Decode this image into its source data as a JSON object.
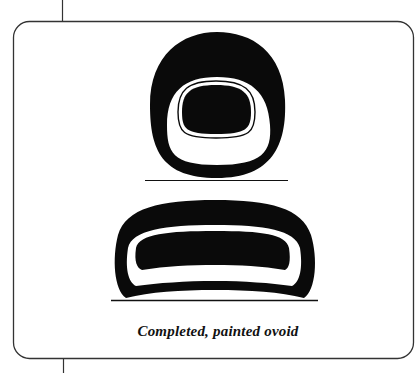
{
  "figure": {
    "caption": "Completed, painted ovoid",
    "shapes": [
      {
        "name": "tall-ovoid",
        "description": "Upright ovoid with white inner band and black core"
      },
      {
        "name": "wide-ovoid",
        "description": "Flattened wide ovoid with white inner band and black core"
      }
    ],
    "colors": {
      "ink": "#0a0a0a",
      "paper": "#ffffff",
      "frame": "#333333"
    }
  }
}
